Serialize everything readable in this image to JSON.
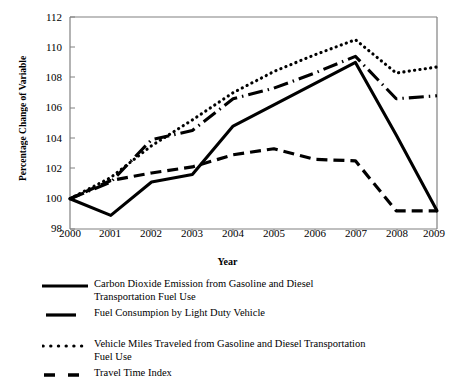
{
  "chart_data": {
    "type": "line",
    "title": "",
    "xlabel": "Year",
    "ylabel": "Percentage Change of Variable",
    "x": [
      2000,
      2001,
      2002,
      2003,
      2004,
      2005,
      2006,
      2007,
      2008,
      2009
    ],
    "categories": [
      "2000",
      "2001",
      "2002",
      "2003",
      "2004",
      "2005",
      "2006",
      "2007",
      "2008",
      "2009"
    ],
    "xlim": [
      2000,
      2009
    ],
    "ylim": [
      98,
      112
    ],
    "yticks": [
      98,
      100,
      102,
      104,
      106,
      108,
      110,
      112
    ],
    "ytick_labels": [
      "98",
      "100",
      "102",
      "104",
      "106",
      "108",
      "110",
      "112"
    ],
    "grid": false,
    "legend_position": "below",
    "series": [
      {
        "name": "Carbon Dioxide Emission from Gasoline and Diesel Transportation Fuel Use",
        "style": "solid",
        "values": [
          100.0,
          98.9,
          101.1,
          101.6,
          104.8,
          106.2,
          107.6,
          109.0,
          104.2,
          99.2
        ]
      },
      {
        "name": "Fuel Consumpion by Light Duty Vehicle",
        "style": "dash-dot",
        "values": [
          100.0,
          101.1,
          103.9,
          104.5,
          106.6,
          107.3,
          108.3,
          109.4,
          106.6,
          106.8
        ]
      },
      {
        "name": "Vehicle Miles Traveled from Gasoline and Diesel Transportation Fuel Use",
        "style": "dotted",
        "values": [
          100.0,
          101.4,
          103.5,
          105.2,
          107.0,
          108.4,
          109.5,
          110.5,
          108.3,
          108.7
        ]
      },
      {
        "name": "Travel Time Index",
        "style": "dashed",
        "values": [
          100.0,
          101.2,
          101.7,
          102.1,
          102.9,
          103.3,
          102.6,
          102.5,
          99.2,
          99.2
        ]
      }
    ]
  },
  "axis": {
    "y_title": "Percentage Change of Variable",
    "x_title": "Year"
  },
  "legend": {
    "entries": [
      {
        "label": "Carbon Dioxide Emission from Gasoline and Diesel\nTransportation Fuel Use",
        "marker": "solid-line-icon"
      },
      {
        "label": "Fuel Consumpion by Light Duty Vehicle",
        "marker": "solid-short-line-icon"
      },
      {
        "label": "Vehicle Miles Traveled from Gasoline and Diesel Transportation\nFuel Use",
        "marker": "dotted-line-icon"
      },
      {
        "label": "Travel Time Index",
        "marker": "dashed-line-icon"
      }
    ]
  },
  "colors": {
    "line": "#000000",
    "axis": "#808080",
    "background": "#ffffff"
  }
}
